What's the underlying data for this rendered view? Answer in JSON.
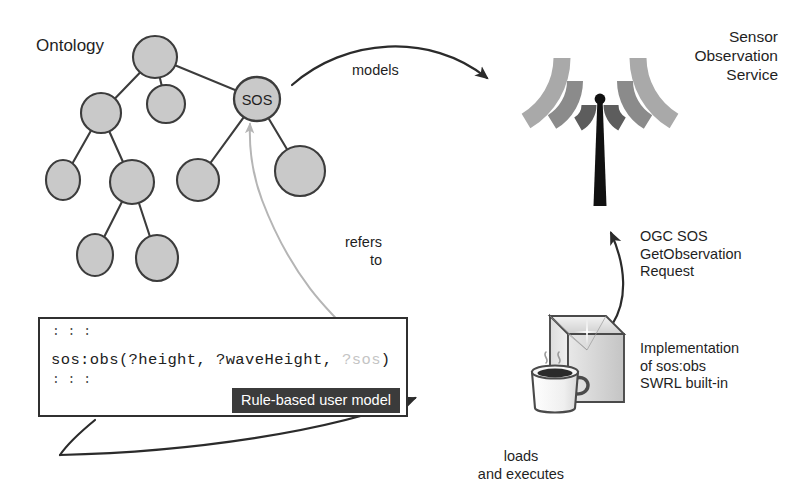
{
  "figure": {
    "kind": "architecture-diagram",
    "background": "#ffffff"
  },
  "ontology": {
    "label": "Ontology",
    "node_fill": "#c9c9c9",
    "node_stroke": "#3c3c3c",
    "highlighted_node_label": "SOS",
    "nodes": [
      {
        "id": "n0",
        "label": "",
        "cx": 155,
        "cy": 57,
        "rx": 22,
        "ry": 21
      },
      {
        "id": "n1",
        "label": "",
        "cx": 101,
        "cy": 113,
        "rx": 20,
        "ry": 20
      },
      {
        "id": "n2",
        "label": "",
        "cx": 166,
        "cy": 104,
        "rx": 19,
        "ry": 19
      },
      {
        "id": "n3",
        "label": "SOS",
        "cx": 257,
        "cy": 99,
        "rx": 23,
        "ry": 22
      },
      {
        "id": "n4",
        "label": "",
        "cx": 63,
        "cy": 180,
        "rx": 17,
        "ry": 20
      },
      {
        "id": "n5",
        "label": "",
        "cx": 132,
        "cy": 182,
        "rx": 22,
        "ry": 22
      },
      {
        "id": "n6",
        "label": "",
        "cx": 198,
        "cy": 180,
        "rx": 21,
        "ry": 21
      },
      {
        "id": "n7",
        "label": "",
        "cx": 300,
        "cy": 171,
        "rx": 25,
        "ry": 25
      },
      {
        "id": "n8",
        "label": "",
        "cx": 95,
        "cy": 255,
        "rx": 18,
        "ry": 21
      },
      {
        "id": "n9",
        "label": "",
        "cx": 157,
        "cy": 258,
        "rx": 21,
        "ry": 23
      }
    ],
    "edges": [
      [
        "n0",
        "n1"
      ],
      [
        "n0",
        "n2"
      ],
      [
        "n0",
        "n3"
      ],
      [
        "n1",
        "n4"
      ],
      [
        "n1",
        "n5"
      ],
      [
        "n5",
        "n8"
      ],
      [
        "n5",
        "n9"
      ],
      [
        "n3",
        "n6"
      ],
      [
        "n3",
        "n7"
      ]
    ]
  },
  "rule_box": {
    "dots_top": ":\n:\n:",
    "dots_bottom": ":\n:\n:",
    "code_prefix": "sos:obs(?height, ?waveHeight, ",
    "code_dim": "?sos",
    "code_suffix": ")",
    "caption": "Rule-based user model",
    "caption_bg": "#3b3b3b",
    "caption_fg": "#ffffff",
    "border_color": "#303030"
  },
  "sensor_service": {
    "title": "Sensor\nObservation\nService",
    "arc_colors": [
      "#a9a9a9",
      "#8b8b8b",
      "#5d5d5d"
    ],
    "mast_color": "#111111"
  },
  "java_node": {
    "box_stroke": "#4a4a4a",
    "box_fill": "#e3e3e3",
    "cup_fill": "#f2f2f2",
    "coffee_fill": "#2a2a2a",
    "caption": "Implementation\nof sos:obs\nSWRL built-in"
  },
  "arrows": {
    "models": {
      "label": "models",
      "color": "#2b2b2b",
      "from": "ontology SOS node",
      "to": "Sensor Observation Service"
    },
    "refers_to": {
      "label": "refers\nto",
      "color": "#b5b5b5",
      "from": "?sos variable in rule",
      "to": "SOS ontology node"
    },
    "request": {
      "label": "OGC SOS\nGetObservation\nRequest",
      "color": "#2b2b2b",
      "from": "Java implementation",
      "to": "Sensor Observation Service"
    },
    "loads": {
      "label": "loads\nand executes",
      "color": "#2b2b2b",
      "from": "Rule-based user model",
      "to": "Java implementation"
    }
  }
}
